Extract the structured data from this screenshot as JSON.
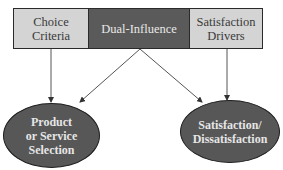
{
  "diagram": {
    "top_boxes": [
      {
        "id": "choice-criteria",
        "label": "Choice\nCriteria",
        "fill": "#d4d4d4"
      },
      {
        "id": "dual-influence",
        "label": "Dual-Influence",
        "fill": "#5a5a5a"
      },
      {
        "id": "satisfaction-drivers",
        "label": "Satisfaction\nDrivers",
        "fill": "#d4d4d4"
      }
    ],
    "outcomes": [
      {
        "id": "product-selection",
        "label": "Product\nor Service\nSelection",
        "fill": "#575757"
      },
      {
        "id": "satisfaction",
        "label": "Satisfaction/\nDissatisfaction",
        "fill": "#575757"
      }
    ],
    "edges": [
      {
        "from": "choice-criteria",
        "to": "product-selection"
      },
      {
        "from": "dual-influence",
        "to": "product-selection"
      },
      {
        "from": "dual-influence",
        "to": "satisfaction"
      },
      {
        "from": "satisfaction-drivers",
        "to": "satisfaction"
      }
    ]
  }
}
